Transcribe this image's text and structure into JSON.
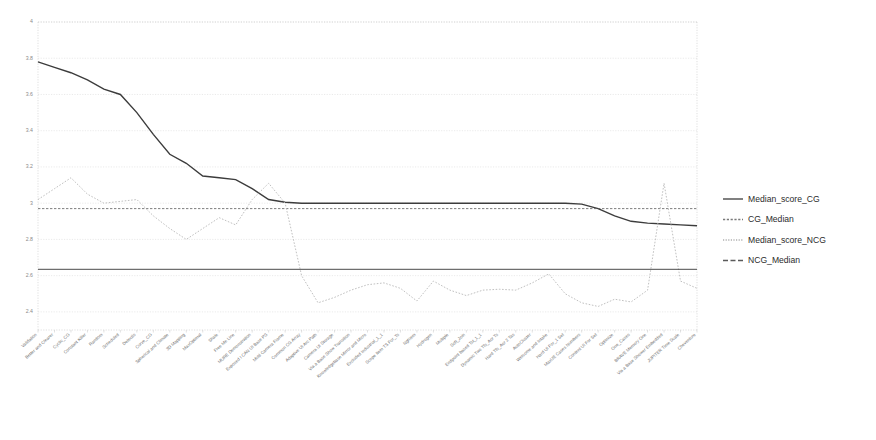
{
  "chart_data": {
    "type": "line",
    "title": "",
    "subtitle": "",
    "xlabel": "",
    "ylabel": "",
    "ylim": [
      2.3,
      4.0
    ],
    "yticks": [
      "2.4",
      "2.6",
      "2.8",
      "3",
      "3.2",
      "3.4",
      "3.6",
      "3.8",
      "4"
    ],
    "ytick_values": [
      2.4,
      2.6,
      2.8,
      3.0,
      3.2,
      3.4,
      3.6,
      3.8,
      4.0
    ],
    "grid": true,
    "legend_position": "right",
    "categories": [
      "Validation",
      "Better and Clearer",
      "Cyclic_CG",
      "Constant Killer",
      "Random",
      "Scheduled",
      "Detectis",
      "Curve_CG",
      "Spherical and Climate",
      "3D Mapping",
      "MaxOptimal",
      "Shale",
      "Free Me Line",
      "MURE Demonstration",
      "Exposed I CAN UI Base PS",
      "Multi Camera Frame",
      "Common CG Array",
      "Adaptive UI Arc Path",
      "Camera UI Storage",
      "Via a Base Show Transition",
      "Knowledgebase Mirror and Micro",
      "Excluded Industrial_1_1",
      "Scope Item TS For_Ts",
      "Nghiem",
      "Hydrogen",
      "Multiple",
      "Soft_Join",
      "Endpoint based Tst_1_1",
      "Dynamic Two Tfs_Aor Ts",
      "Hard Tfs_Aor 2 Tas",
      "AutoCluster",
      "Welcome and Intake",
      "Hard UI For_1 Set",
      "MaxUE Cases Numbers",
      "Content UI For Set",
      "Optimize",
      "One_Cases",
      "BRAVE Memory One",
      "Via a Base Shower Embedded",
      "JUPITER Time Scale",
      "Cheventure"
    ],
    "series": [
      {
        "name": "Median_score_CG",
        "style": "solid",
        "color": "#3c3c3c",
        "width": 1.4,
        "values": [
          3.78,
          3.75,
          3.72,
          3.68,
          3.63,
          3.6,
          3.5,
          3.38,
          3.27,
          3.22,
          3.15,
          3.14,
          3.13,
          3.08,
          3.02,
          3.005,
          3.0,
          3.0,
          3.0,
          3.0,
          3.0,
          3.0,
          3.0,
          3.0,
          3.0,
          3.0,
          3.0,
          3.0,
          3.0,
          3.0,
          3.0,
          3.0,
          3.0,
          2.995,
          2.97,
          2.93,
          2.9,
          2.89,
          2.885,
          2.88,
          2.875
        ]
      },
      {
        "name": "CG_Median",
        "style": "dashed-reference",
        "color": "#5a5a5a",
        "width": 0.8,
        "constant": 2.97
      },
      {
        "name": "Median_score_NCG",
        "style": "dotted",
        "color": "#b9b9b9",
        "width": 0.9,
        "values": [
          3.02,
          3.08,
          3.14,
          3.05,
          3.0,
          3.01,
          3.02,
          2.93,
          2.86,
          2.8,
          2.86,
          2.92,
          2.88,
          3.02,
          3.11,
          3.0,
          2.6,
          2.45,
          2.48,
          2.52,
          2.55,
          2.56,
          2.53,
          2.46,
          2.57,
          2.52,
          2.49,
          2.52,
          2.525,
          2.52,
          2.56,
          2.61,
          2.5,
          2.45,
          2.43,
          2.47,
          2.455,
          2.52,
          3.11,
          2.57,
          2.53
        ]
      },
      {
        "name": "NCG_Median",
        "style": "solid-reference",
        "color": "#4a4a4a",
        "width": 1.0,
        "constant": 2.635
      }
    ],
    "legend": [
      {
        "label": "Median_score_CG",
        "style": "solid",
        "color": "#3c3c3c"
      },
      {
        "label": "CG_Median",
        "style": "dashed",
        "color": "#7a7a7a"
      },
      {
        "label": "Median_score_NCG",
        "style": "dotted",
        "color": "#b0b0b0"
      },
      {
        "label": "NCG_Median",
        "style": "dashed-long",
        "color": "#5a5a5a"
      }
    ]
  }
}
